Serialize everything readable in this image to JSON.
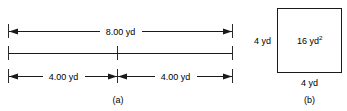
{
  "figure": {
    "panel_a": {
      "caption": "(a)",
      "top_dimension": {
        "label": "8.00 yd",
        "value": 8.0,
        "unit": "yd"
      },
      "bottom_dimensions": [
        {
          "label": "4.00 yd",
          "value": 4.0,
          "unit": "yd"
        },
        {
          "label": "4.00 yd",
          "value": 4.0,
          "unit": "yd"
        }
      ]
    },
    "panel_b": {
      "caption": "(b)",
      "area_label": "16 yd",
      "area_exponent": "2",
      "side_left_label": "4 yd",
      "side_bottom_label": "4 yd"
    },
    "colors": {
      "line": "#1a1a1a",
      "text": "#000000",
      "background": "#ffffff"
    }
  }
}
